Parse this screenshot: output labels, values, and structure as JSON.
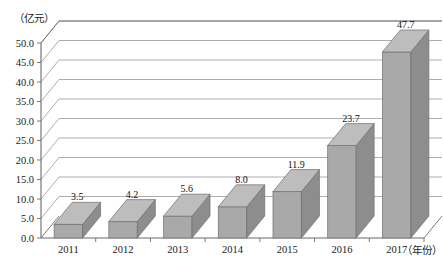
{
  "chart_data": {
    "type": "bar",
    "title": "",
    "subtitle": "",
    "xlabel": "（年份）",
    "ylabel": "（亿元）",
    "categories": [
      "2011",
      "2012",
      "2013",
      "2014",
      "2015",
      "2016",
      "2017"
    ],
    "values": [
      3.5,
      4.2,
      5.6,
      8.0,
      11.9,
      23.7,
      47.7
    ],
    "value_labels": [
      "3.5",
      "4.2",
      "5.6",
      "8.0",
      "11.9",
      "23.7",
      "47.7"
    ],
    "ylim": [
      0,
      50
    ],
    "ytick_step": 5,
    "ytick_labels": [
      "0.0",
      "5.0",
      "10.0",
      "15.0",
      "20.0",
      "25.0",
      "30.0",
      "35.0",
      "40.0",
      "45.0",
      "50.0"
    ],
    "grid": true,
    "legend": false,
    "legend_position": "none",
    "three_d": true,
    "series": [
      {
        "name": "",
        "values": [
          3.5,
          4.2,
          5.6,
          8.0,
          11.9,
          23.7,
          47.7
        ]
      }
    ],
    "colors": {
      "bar_front": "#a9a9a9",
      "bar_side": "#8d8d8d",
      "bar_top": "#bdbdbd",
      "bar_stroke": "#6f6f6f",
      "gridline": "#8a8a8a",
      "axis": "#6b6b6b",
      "background": "#ffffff",
      "text": "#1a1a1a"
    }
  }
}
